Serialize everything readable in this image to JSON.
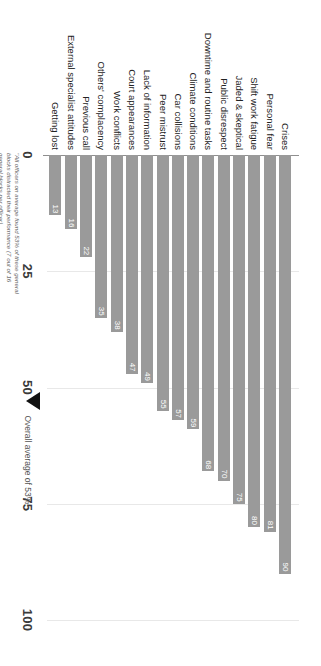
{
  "chart_data": {
    "type": "bar",
    "orientation": "horizontal",
    "title": "",
    "xlabel": "",
    "ylabel": "",
    "xlim": [
      0,
      100
    ],
    "ticks": [
      0,
      25,
      50,
      75,
      100
    ],
    "grid": true,
    "legend": false,
    "categories": [
      "Crises",
      "Personal fear",
      "Shift work fatigue",
      "Jaded & skeptical",
      "Public disrespect",
      "Downtime and routine tasks",
      "Climate conditions",
      "Car collisions",
      "Peer mistrust",
      "Lack of information",
      "Court appearances",
      "Work conflicts",
      "Others' complacency",
      "Previous call",
      "External specialist attitudes",
      "Getting lost"
    ],
    "values": [
      90,
      81,
      80,
      75,
      70,
      68,
      59,
      57,
      55,
      49,
      47,
      38,
      35,
      22,
      16,
      13
    ],
    "bar_color": "#9a9a9a",
    "annotations": [
      {
        "name": "overall-average",
        "label": "Overall average of 53%",
        "value": 53
      }
    ],
    "footnote": "\"All officers on average found 53% of these general blocks distracted their performance (7 out of 16 general blocks per officer)"
  }
}
